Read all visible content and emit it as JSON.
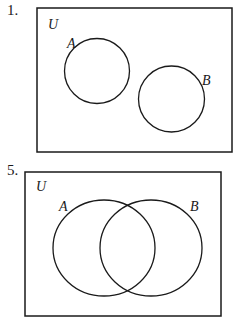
{
  "diagrams": [
    {
      "number": "1.",
      "universe_label": "U",
      "set_a_label": "A",
      "set_b_label": "B",
      "relationship": "disjoint"
    },
    {
      "number": "5.",
      "universe_label": "U",
      "set_a_label": "A",
      "set_b_label": "B",
      "relationship": "overlapping"
    }
  ],
  "colors": {
    "stroke": "#1a1a1a",
    "background": "#ffffff"
  }
}
